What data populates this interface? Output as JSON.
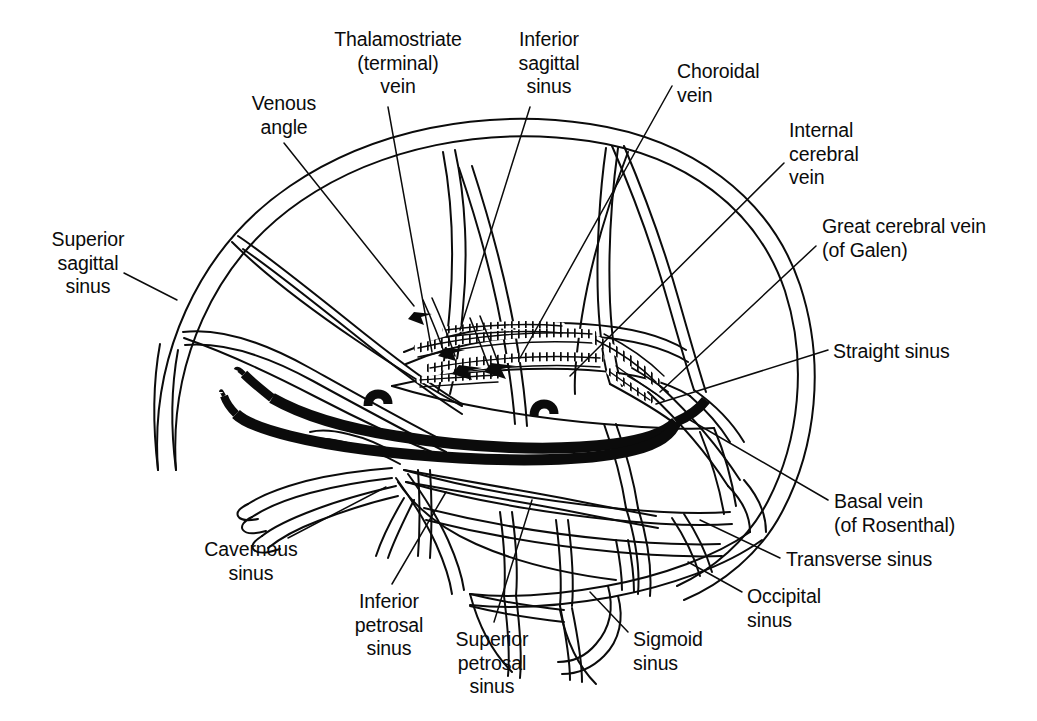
{
  "figure": {
    "background_color": "#ffffff",
    "ink_color": "#0b0b0b"
  },
  "labels": [
    {
      "key": "venous_angle",
      "text": "Venous\nangle",
      "align": "center",
      "x": 224,
      "y": 92,
      "w": 120
    },
    {
      "key": "thalamostriate_vein",
      "text": "Thalamostriate\n(terminal)\nvein",
      "align": "center",
      "x": 318,
      "y": 28,
      "w": 160
    },
    {
      "key": "inferior_sagittal_sinus",
      "text": "Inferior\nsagittal\nsinus",
      "align": "center",
      "x": 495,
      "y": 28,
      "w": 108
    },
    {
      "key": "choroidal_vein",
      "text": "Choroidal\nvein",
      "align": "left",
      "x": 677,
      "y": 60,
      "w": 130
    },
    {
      "key": "internal_cerebral_vein",
      "text": "Internal\ncerebral\nvein",
      "align": "left",
      "x": 789,
      "y": 119,
      "w": 120
    },
    {
      "key": "great_cerebral_vein",
      "text": "Great cerebral vein\n(of Galen)",
      "align": "left",
      "x": 822,
      "y": 215,
      "w": 210
    },
    {
      "key": "straight_sinus",
      "text": "Straight sinus",
      "align": "left",
      "x": 833,
      "y": 340,
      "w": 150
    },
    {
      "key": "basal_vein",
      "text": "Basal vein\n(of Rosenthal)",
      "align": "left",
      "x": 834,
      "y": 490,
      "w": 160
    },
    {
      "key": "transverse_sinus",
      "text": "Transverse sinus",
      "align": "left",
      "x": 786,
      "y": 548,
      "w": 180
    },
    {
      "key": "occipital_sinus",
      "text": "Occipital\nsinus",
      "align": "left",
      "x": 747,
      "y": 585,
      "w": 110
    },
    {
      "key": "sigmoid_sinus",
      "text": "Sigmoid\nsinus",
      "align": "left",
      "x": 633,
      "y": 628,
      "w": 110
    },
    {
      "key": "superior_petrosal_sinus",
      "text": "Superior\npetrosal\nsinus",
      "align": "center",
      "x": 437,
      "y": 628,
      "w": 110
    },
    {
      "key": "inferior_petrosal_sinus",
      "text": "Inferior\npetrosal\nsinus",
      "align": "center",
      "x": 334,
      "y": 590,
      "w": 110
    },
    {
      "key": "cavernous_sinus",
      "text": "Cavernous\nsinus",
      "align": "center",
      "x": 186,
      "y": 538,
      "w": 130
    },
    {
      "key": "superior_sagittal_sinus",
      "text": "Superior\nsagittal\nsinus",
      "align": "center",
      "x": 28,
      "y": 228,
      "w": 120
    }
  ],
  "structures": [
    {
      "key": "cranial-vault-outline",
      "name": "Cranial vault outline"
    },
    {
      "key": "superior-sagittal-sinus",
      "name": "Superior sagittal sinus"
    },
    {
      "key": "inferior-sagittal-sinus",
      "name": "Inferior sagittal sinus"
    },
    {
      "key": "straight-sinus",
      "name": "Straight sinus"
    },
    {
      "key": "great-cerebral-vein",
      "name": "Great cerebral vein (of Galen)"
    },
    {
      "key": "internal-cerebral-vein",
      "name": "Internal cerebral vein"
    },
    {
      "key": "thalamostriate-vein",
      "name": "Thalamostriate (terminal) vein"
    },
    {
      "key": "choroidal-vein",
      "name": "Choroidal vein"
    },
    {
      "key": "basal-vein",
      "name": "Basal vein (of Rosenthal)"
    },
    {
      "key": "venous-angle",
      "name": "Venous angle"
    },
    {
      "key": "transverse-sinus",
      "name": "Transverse sinus"
    },
    {
      "key": "sigmoid-sinus",
      "name": "Sigmoid sinus"
    },
    {
      "key": "occipital-sinus",
      "name": "Occipital sinus"
    },
    {
      "key": "cavernous-sinus",
      "name": "Cavernous sinus"
    },
    {
      "key": "superior-petrosal-sinus",
      "name": "Superior petrosal sinus"
    },
    {
      "key": "inferior-petrosal-sinus",
      "name": "Inferior petrosal sinus"
    },
    {
      "key": "confluence-of-sinuses",
      "name": "Confluence of sinuses"
    }
  ]
}
